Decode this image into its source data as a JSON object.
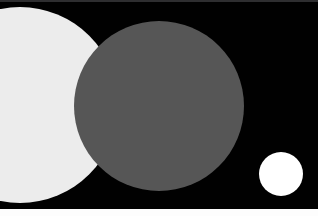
{
  "canvas": {
    "width": 318,
    "height": 216,
    "background_color": "#ffffff",
    "title": "Abstract Circles Composition"
  },
  "field": {
    "name": "dark-field",
    "color": "#010101",
    "x": 0,
    "y": 0,
    "width": 318,
    "height": 209
  },
  "top_rule": {
    "name": "top-edge-rule",
    "color": "#2e2e30",
    "height": 2
  },
  "bottom_band": {
    "name": "bottom-white-band",
    "color": "#fdfdfd",
    "y": 209,
    "height": 7
  },
  "shapes": [
    {
      "id": "pale-circle",
      "label": "Large pale circle",
      "color": "#ececec",
      "center_x": 20,
      "center_y": 105,
      "radius": 98,
      "clipped": "left"
    },
    {
      "id": "gray-circle",
      "label": "Large gray circle",
      "color": "#565656",
      "center_x": 159,
      "center_y": 106,
      "radius": 85,
      "clipped": "none"
    },
    {
      "id": "white-dot",
      "label": "Small white circle",
      "color": "#ffffff",
      "center_x": 281,
      "center_y": 174,
      "radius": 22,
      "clipped": "none"
    }
  ]
}
